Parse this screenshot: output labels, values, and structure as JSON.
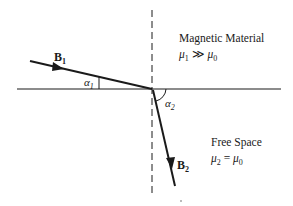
{
  "diagram": {
    "regions": {
      "upper": {
        "name": "Magnetic Material",
        "relation_lhs": "μ",
        "relation_lhs_sub": "1",
        "relation_op": "≫",
        "relation_rhs": "μ",
        "relation_rhs_sub": "0"
      },
      "lower": {
        "name": "Free Space",
        "relation_lhs": "μ",
        "relation_lhs_sub": "2",
        "relation_op": "=",
        "relation_rhs": "μ",
        "relation_rhs_sub": "0"
      }
    },
    "vectors": {
      "incident": {
        "symbol": "B",
        "sub": "1"
      },
      "refracted": {
        "symbol": "B",
        "sub": "2"
      }
    },
    "angles": {
      "a1": {
        "symbol": "α",
        "sub": "1"
      },
      "a2": {
        "symbol": "α",
        "sub": "2"
      }
    },
    "colors": {
      "line": "#1a1a1a",
      "background": "#ffffff"
    }
  }
}
